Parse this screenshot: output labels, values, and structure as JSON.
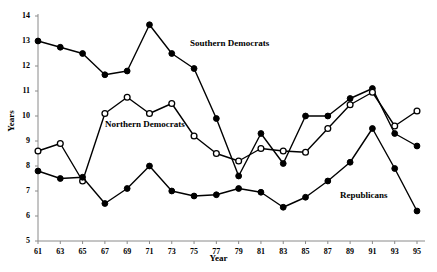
{
  "chart_data": {
    "type": "line",
    "title": "",
    "title_note": "cropped-at-top",
    "xlabel": "Year",
    "ylabel": "Years",
    "x": [
      61,
      63,
      65,
      67,
      69,
      71,
      73,
      75,
      77,
      79,
      81,
      83,
      85,
      87,
      89,
      91,
      93,
      95
    ],
    "xtick_labels": [
      "61",
      "63",
      "65",
      "67",
      "69",
      "71",
      "73",
      "75",
      "77",
      "79",
      "81",
      "83",
      "85",
      "87",
      "89",
      "91",
      "93",
      "95"
    ],
    "ytick_labels": [
      "5",
      "6",
      "7",
      "8",
      "9",
      "10",
      "11",
      "12",
      "13",
      "14"
    ],
    "xlim": [
      61,
      95
    ],
    "ylim": [
      5,
      14
    ],
    "grid": false,
    "legend_position": "inline-annotations",
    "series": [
      {
        "name": "Southern Democrats",
        "marker": "filled-circle",
        "color": "#000000",
        "values": [
          13.0,
          12.75,
          12.5,
          11.65,
          11.8,
          13.65,
          12.5,
          11.9,
          9.9,
          7.6,
          9.3,
          8.1,
          10.0,
          10.0,
          10.7,
          11.1,
          9.3,
          8.8
        ]
      },
      {
        "name": "Northern Democrats",
        "marker": "open-circle",
        "color": "#000000",
        "values": [
          8.6,
          8.9,
          7.4,
          10.1,
          10.75,
          10.1,
          10.5,
          9.2,
          8.5,
          8.2,
          8.7,
          8.6,
          8.55,
          9.5,
          10.45,
          10.95,
          9.6,
          10.2
        ]
      },
      {
        "name": "Republicans",
        "marker": "filled-circle",
        "color": "#000000",
        "values": [
          7.8,
          7.5,
          7.55,
          6.5,
          7.1,
          8.0,
          7.0,
          6.8,
          6.85,
          7.1,
          6.95,
          6.35,
          6.75,
          7.4,
          8.15,
          9.5,
          7.9,
          6.2
        ]
      }
    ],
    "annotations": [
      {
        "text": "Southern Democrats",
        "x": 190,
        "y": 38
      },
      {
        "text": "Northern Democrats",
        "x": 105,
        "y": 119
      },
      {
        "text": "Republicans",
        "x": 340,
        "y": 190
      }
    ]
  }
}
